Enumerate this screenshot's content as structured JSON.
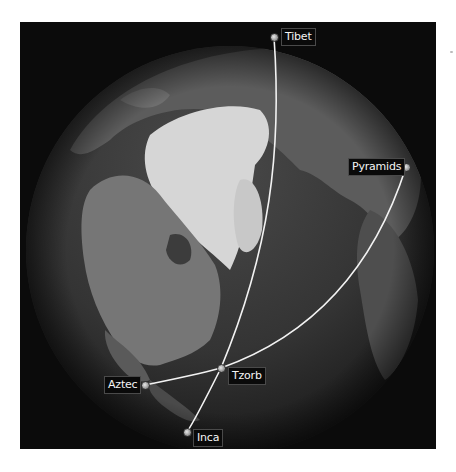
{
  "map": {
    "view": "orthographic-globe-north-pole",
    "colors": {
      "background": "#0b0b0b",
      "ocean": "#2e2e2e",
      "land": "#6a6a6a",
      "ice": "#d8d8d8",
      "arc": "#f2f2f2",
      "label_bg": "#0a0a0a",
      "label_text": "#f4f4f4"
    },
    "locations": [
      {
        "id": "tibet",
        "label": "Tibet",
        "x": 274,
        "y": 37
      },
      {
        "id": "pyramids",
        "label": "Pyramids",
        "x": 406,
        "y": 167
      },
      {
        "id": "tzorb",
        "label": "Tzorb",
        "x": 221,
        "y": 368
      },
      {
        "id": "aztec",
        "label": "Aztec",
        "x": 145,
        "y": 385
      },
      {
        "id": "inca",
        "label": "Inca",
        "x": 187,
        "y": 432
      }
    ],
    "routes": [
      {
        "from": "Tibet",
        "to": "Inca",
        "via": "Tzorb"
      },
      {
        "from": "Aztec",
        "to": "Pyramids",
        "via": "Tzorb"
      }
    ]
  }
}
